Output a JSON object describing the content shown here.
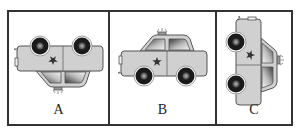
{
  "figure": {
    "panels": [
      {
        "label": "A",
        "orientation": "upside-down (vertical flip)"
      },
      {
        "label": "B",
        "orientation": "upright"
      },
      {
        "label": "C",
        "orientation": "rotated 90 degrees"
      }
    ],
    "colors": {
      "border": "#333333",
      "car_body": "#d0d0d0",
      "car_outline": "#555555",
      "tire": "#1a1a1a",
      "window_dark": "#444444",
      "window_light": "#f2f2f2"
    }
  }
}
